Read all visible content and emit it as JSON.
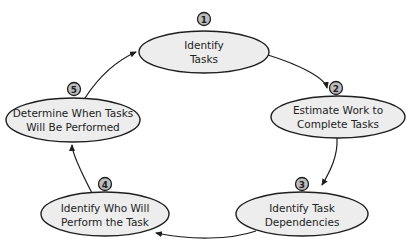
{
  "diagram": {
    "type": "cycle",
    "steps": [
      {
        "number": "1",
        "line1": "Identify",
        "line2": "Tasks"
      },
      {
        "number": "2",
        "line1": "Estimate Work to",
        "line2": "Complete Tasks"
      },
      {
        "number": "3",
        "line1": "Identify Task",
        "line2": "Dependencies"
      },
      {
        "number": "4",
        "line1": "Identify Who Will",
        "line2": "Perform the Task"
      },
      {
        "number": "5",
        "line1": "Determine When Tasks",
        "line2": "Will Be Performed"
      }
    ],
    "flow": [
      "1 to 2",
      "2 to 3",
      "3 to 4",
      "4 to 5",
      "5 to 1"
    ]
  }
}
